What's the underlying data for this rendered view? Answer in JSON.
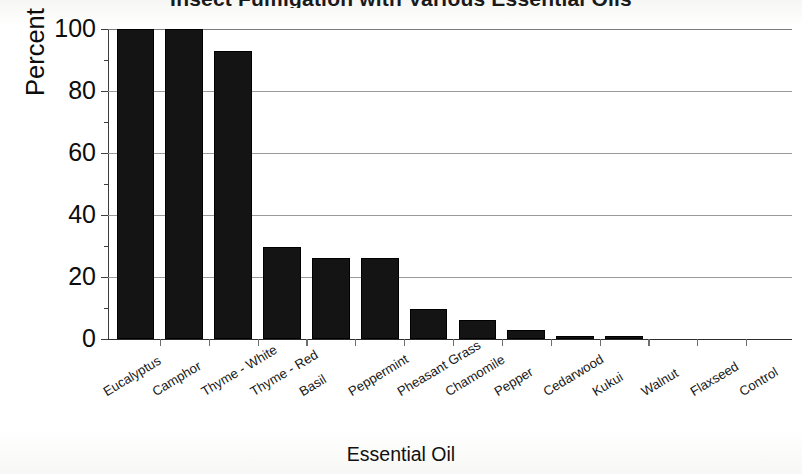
{
  "chart_data": {
    "type": "bar",
    "title": "Insect Fumigation with Various Essential Oils",
    "xlabel": "Essential Oil",
    "ylabel": "Percent Mortality",
    "categories": [
      "Eucalyptus",
      "Camphor",
      "Thyme - White",
      "Thyme - Red",
      "Basil",
      "Peppermint",
      "Pheasant Grass",
      "Chamomile",
      "Pepper",
      "Cedarwood",
      "Kukui",
      "Walnut",
      "Flaxseed",
      "Control"
    ],
    "values": [
      100,
      100,
      93,
      29.5,
      26,
      26,
      9.5,
      6,
      2.7,
      0.7,
      0.7,
      0,
      0,
      0
    ],
    "ylim": [
      0,
      100
    ],
    "ytick_labels": [
      "0",
      "20",
      "40",
      "60",
      "80",
      "100"
    ],
    "ytick_values": [
      0,
      20,
      40,
      60,
      80,
      100
    ],
    "yminor_step": 10,
    "grid": "horizontal",
    "legend": "none",
    "bar_color": "#141414"
  },
  "axes": {
    "y_title": "Percent Mortality",
    "x_title": "Essential Oil"
  }
}
